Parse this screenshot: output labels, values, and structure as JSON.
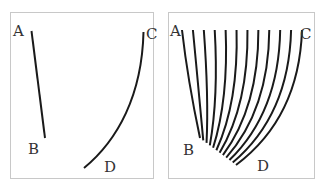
{
  "diagram": {
    "type": "line-diagram",
    "stroke_color": "#1a1a1a",
    "border_color": "#c8c8c8",
    "left_panel": {
      "labels": {
        "a": "A",
        "b": "B",
        "c": "C",
        "d": "D"
      },
      "paths": [
        {
          "name": "line-a-b",
          "from": "A",
          "to": "B"
        },
        {
          "name": "curve-c-d",
          "from": "C",
          "to": "D"
        }
      ]
    },
    "right_panel": {
      "labels": {
        "a": "A",
        "b": "B",
        "c": "C",
        "d": "D"
      },
      "curve_count": 12,
      "description": "Family of curves interpolating between line A-B and curve C-D"
    }
  }
}
